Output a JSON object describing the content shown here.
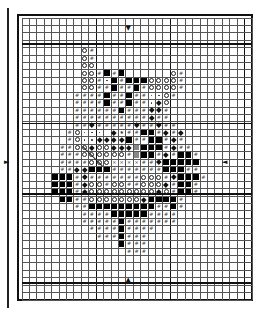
{
  "pattern": {
    "columns": 31,
    "rows": 38,
    "cell_size": 7.42,
    "thick_line_every": 10,
    "legend_codes": {
      ".": "empty",
      "O": "open-circle",
      "#": "hash",
      "B": "filled-square",
      "G": "gray-square",
      "d": "small-dot",
      "D": "diamond",
      "x": "cross",
      "*": "star"
    },
    "grid": [
      "...............................",
      "...............................",
      "...............................",
      "...............................",
      "........O#.....................",
      "........O#.....................",
      "........OO.....................",
      "........OO#B#B......O#.........",
      "........OO#dB#BBBOOOO#.........",
      "........OO##B##B#OOOO#.........",
      ".......####B##B##ddO#..........",
      ".......####B##B##dDO...........",
      ".......######B###DD#...........",
      ".......##########D##...........",
      ".......##D#####D##D##..........",
      "......#Oddd D*##BB#D#D.........",
      "......#OddDDDDB##BB#D#.........",
      ".....##OODOODDDGBBB#D##........",
      ".....###OOOOOO#GBB#D#BB#.......",
      ".....####OOOxxxx##DBBBBB.......",
      ".....##DDBBB#######BBB##.......",
      "....BBB#D#######OOO#DBBB#......",
      "....BBB#DOO#OO##OOOD#BB#.......",
      "....BBB#DOOOOOOOOODO#BB#.......",
      ".....BB##OOOOOOODBBBB#.........",
      ".......##BBBBBBBBB##B#.........",
      "........####BBBBB####..........",
      "........#####B#######..........",
      ".........####B####.............",
      "..........###B###..............",
      ".............B###..............",
      "..............###..............",
      "...............................",
      "...............................",
      "...............................",
      "...............................",
      "...............................",
      "..............................."
    ],
    "center_markers": {
      "top": {
        "glyph": "▼",
        "col": 14,
        "row": 1
      },
      "bottom": {
        "glyph": "▲",
        "col": 14,
        "row": 35
      },
      "left": {
        "glyph": "►",
        "col": -2.4,
        "row": 19
      },
      "right": {
        "glyph": "◄",
        "col": 27,
        "row": 19
      }
    }
  }
}
